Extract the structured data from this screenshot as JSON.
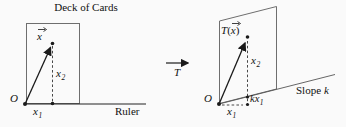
{
  "figure": {
    "left": {
      "title": "Deck of Cards",
      "origin_label": "O",
      "vector_letter": "x",
      "x1": {
        "base": "x",
        "sub": "1"
      },
      "x2": {
        "base": "x",
        "sub": "2"
      },
      "ruler_label": "Ruler"
    },
    "middle": {
      "transform_label": "T"
    },
    "right": {
      "image_label": {
        "t": "T",
        "open": "(",
        "letter": "x",
        "close": ")"
      },
      "origin_label": "O",
      "x1": {
        "base": "x",
        "sub": "1"
      },
      "x2": {
        "base": "x",
        "sub": "2"
      },
      "kx1": {
        "coef": "k",
        "base": "x",
        "sub": "1"
      },
      "slope_label": {
        "text": "Slope",
        "var": "k"
      }
    },
    "colors": {
      "shape_outline": "#6e6e6e",
      "main_stroke": "#1a1a1a",
      "background": "#fafafa"
    }
  }
}
